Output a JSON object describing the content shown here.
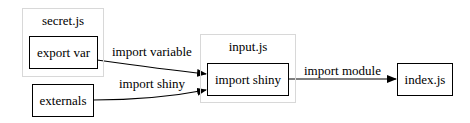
{
  "diagram": {
    "clusters": [
      {
        "id": "secret",
        "label": "secret.js"
      },
      {
        "id": "input",
        "label": "input.js"
      }
    ],
    "nodes": [
      {
        "id": "export_var",
        "label": "export var",
        "cluster": "secret.js"
      },
      {
        "id": "externals",
        "label": "externals"
      },
      {
        "id": "import_shiny",
        "label": "import shiny",
        "cluster": "input.js"
      },
      {
        "id": "index",
        "label": "index.js"
      }
    ],
    "edges": [
      {
        "from": "export var",
        "to": "import shiny",
        "label": "import variable"
      },
      {
        "from": "externals",
        "to": "import shiny",
        "label": "import shiny"
      },
      {
        "from": "import shiny",
        "to": "index.js",
        "label": "import module"
      }
    ]
  }
}
